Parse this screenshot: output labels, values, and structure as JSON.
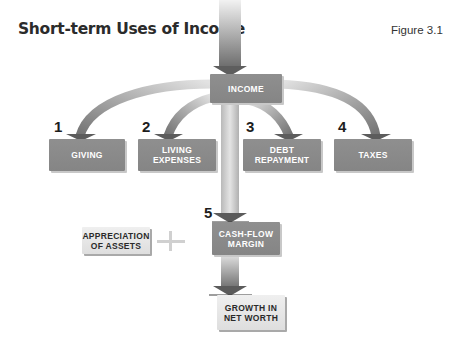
{
  "title": "Short-term Uses of Income",
  "figure_label": "Figure 3.1",
  "nodes": {
    "income": "INCOME",
    "giving": {
      "number": "1",
      "label": "GIVING"
    },
    "living_expenses": {
      "number": "2",
      "label_line1": "LIVING",
      "label_line2": "EXPENSES"
    },
    "debt_repayment": {
      "number": "3",
      "label_line1": "DEBT",
      "label_line2": "REPAYMENT"
    },
    "taxes": {
      "number": "4",
      "label": "TAXES"
    },
    "cash_flow_margin": {
      "number": "5",
      "label_line1": "CASH-FLOW",
      "label_line2": "MARGIN"
    },
    "appreciation_of_assets": {
      "label_line1": "APPRECIATION",
      "label_line2": "OF ASSETS"
    },
    "growth_in_net_worth": {
      "label_line1": "GROWTH IN",
      "label_line2": "NET WORTH"
    }
  },
  "operator": "+",
  "edges": [
    {
      "from": "source",
      "to": "INCOME"
    },
    {
      "from": "INCOME",
      "to": "GIVING"
    },
    {
      "from": "INCOME",
      "to": "LIVING EXPENSES"
    },
    {
      "from": "INCOME",
      "to": "DEBT REPAYMENT"
    },
    {
      "from": "INCOME",
      "to": "TAXES"
    },
    {
      "from": "INCOME",
      "to": "CASH-FLOW MARGIN"
    },
    {
      "from": "APPRECIATION OF ASSETS",
      "to": "CASH-FLOW MARGIN",
      "type": "plus"
    },
    {
      "from": "CASH-FLOW MARGIN",
      "to": "GROWTH IN NET WORTH"
    }
  ],
  "colors": {
    "dark_box": "#888888",
    "light_box": "#e6e6e6",
    "arrow_dark": "#7a7a7a",
    "arrow_light": "#d8d8d8",
    "text_dark": "#2b2b2b"
  }
}
